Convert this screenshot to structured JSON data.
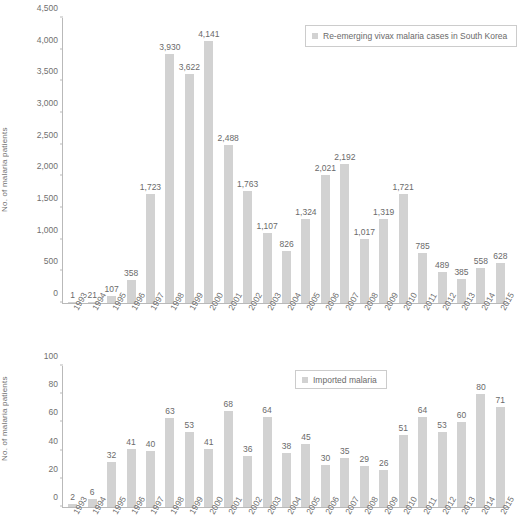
{
  "chart_data": [
    {
      "id": "top",
      "type": "bar",
      "title": "",
      "xlabel": "",
      "ylabel": "No. of malaria patients",
      "ylim": [
        0,
        4500
      ],
      "ytick_values": [
        0,
        500,
        1000,
        1500,
        2000,
        2500,
        3000,
        3500,
        4000,
        4500
      ],
      "ytick_labels": [
        "0",
        "500",
        "1,000",
        "1,500",
        "2,000",
        "2,500",
        "3,000",
        "3,500",
        "4,000",
        "4,500"
      ],
      "grid": false,
      "legend_position": "top-right",
      "legend": [
        "Re-emerging vivax malaria cases in South Korea"
      ],
      "bar_color": "#d2d2d2",
      "categories": [
        "1993",
        "1994",
        "1995",
        "1996",
        "1997",
        "1998",
        "1999",
        "2000",
        "2001",
        "2002",
        "2003",
        "2004",
        "2005",
        "2006",
        "2007",
        "2008",
        "2009",
        "2010",
        "2011",
        "2012",
        "2013",
        "2014",
        "2015"
      ],
      "values": [
        1,
        21,
        107,
        358,
        1723,
        3930,
        3622,
        4141,
        2488,
        1763,
        1107,
        826,
        1324,
        2021,
        2192,
        1017,
        1319,
        1721,
        785,
        489,
        385,
        558,
        628
      ],
      "value_labels": [
        "1",
        "21",
        "107",
        "358",
        "1,723",
        "3,930",
        "3,622",
        "4,141",
        "2,488",
        "1,763",
        "1,107",
        "826",
        "1,324",
        "2,021",
        "2,192",
        "1,017",
        "1,319",
        "1,721",
        "785",
        "489",
        "385",
        "558",
        "628"
      ]
    },
    {
      "id": "bottom",
      "type": "bar",
      "title": "",
      "xlabel": "",
      "ylabel": "No. of malaria patients",
      "ylim": [
        0,
        100
      ],
      "ytick_values": [
        0,
        20,
        40,
        60,
        80,
        100
      ],
      "ytick_labels": [
        "0",
        "20",
        "40",
        "60",
        "80",
        "100"
      ],
      "grid": false,
      "legend_position": "top-center",
      "legend": [
        "Imported malaria"
      ],
      "bar_color": "#d2d2d2",
      "categories": [
        "1993",
        "1994",
        "1995",
        "1996",
        "1997",
        "1998",
        "1999",
        "2000",
        "2001",
        "2002",
        "2003",
        "2004",
        "2005",
        "2006",
        "2007",
        "2008",
        "2009",
        "2010",
        "2011",
        "2012",
        "2013",
        "2014",
        "2015"
      ],
      "values": [
        2,
        6,
        32,
        41,
        40,
        63,
        53,
        41,
        68,
        36,
        64,
        38,
        45,
        30,
        35,
        29,
        26,
        51,
        64,
        53,
        60,
        80,
        71
      ],
      "value_labels": [
        "2",
        "6",
        "32",
        "41",
        "40",
        "63",
        "53",
        "41",
        "68",
        "36",
        "64",
        "38",
        "45",
        "30",
        "35",
        "29",
        "26",
        "51",
        "64",
        "53",
        "60",
        "80",
        "71"
      ]
    }
  ]
}
